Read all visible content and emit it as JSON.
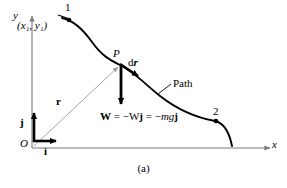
{
  "figure": {
    "caption": "(a)",
    "axes": {
      "y_label": "y",
      "x_label": "x",
      "origin_label": "O"
    },
    "unit_vectors": {
      "i_label": "i",
      "j_label": "j"
    },
    "points": {
      "start_label": "1",
      "start_coordinates": "(x₁, y₁)",
      "mid_label": "P",
      "end_label": "2"
    },
    "vectors": {
      "position_label": "r",
      "displacement_label": "dr",
      "weight_equation": "W = −Wj = −mgj"
    },
    "curve_label": "Path",
    "colors": {
      "axis": "#7a7a7a",
      "curve": "#000000",
      "vector": "#000000",
      "position_vector": "#9a9a9a",
      "background": "#ffffff"
    }
  }
}
